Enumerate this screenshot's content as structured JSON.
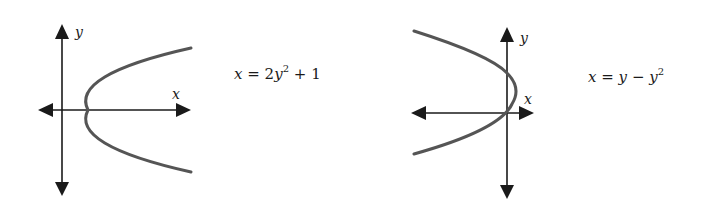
{
  "figures": [
    {
      "id": "graph-1",
      "axis_labels": {
        "x": "x",
        "y": "y"
      },
      "equation": {
        "lhs": "x",
        "eq": "=",
        "coef": "2",
        "var": "y",
        "exp": "2",
        "op": "+",
        "const": "1"
      },
      "equation_text": "x = 2y^2 + 1",
      "curve_color": "#555555"
    },
    {
      "id": "graph-2",
      "axis_labels": {
        "x": "x",
        "y": "y"
      },
      "equation": {
        "lhs": "x",
        "eq": "=",
        "var1": "y",
        "op": "−",
        "var2": "y",
        "exp": "2"
      },
      "equation_text": "x = y - y^2",
      "curve_color": "#555555"
    }
  ]
}
